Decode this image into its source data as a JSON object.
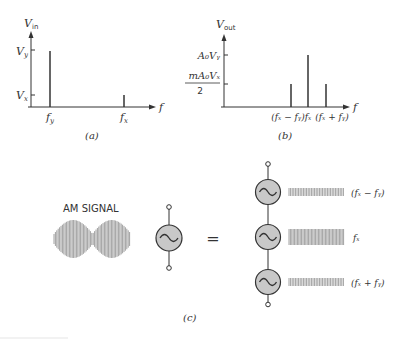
{
  "panel_a": {
    "y_axis_label": "V",
    "y_axis_sub": "in",
    "x_axis_label": "f",
    "tick_vy": "V",
    "tick_vy_sub": "y",
    "tick_vx": "V",
    "tick_vx_sub": "x",
    "x_tick_fy": "f",
    "x_tick_fy_sub": "y",
    "x_tick_fx": "f",
    "x_tick_fx_sub": "x",
    "caption": "(a)"
  },
  "panel_b": {
    "y_axis_label": "V",
    "y_axis_sub": "out",
    "x_axis_label": "f",
    "tick_high": "A₀Vᵧ",
    "tick_low_num": "mA₀Vₓ",
    "tick_low_den": "2",
    "x_tick_lower": "(fₓ − fᵧ)",
    "x_tick_center": "fₓ",
    "x_tick_upper": "(fₓ + fᵧ)",
    "caption": "(b)"
  },
  "panel_c": {
    "am_label": "AM SIGNAL",
    "equals": "=",
    "components": [
      {
        "label": "(fₓ − fᵧ)"
      },
      {
        "label": "fₓ"
      },
      {
        "label": "(fₓ + fᵧ)"
      }
    ],
    "caption": "(c)"
  },
  "colors": {
    "ink": "#333333",
    "generator_fill": "#c8c8c8",
    "signal": "#888888"
  }
}
